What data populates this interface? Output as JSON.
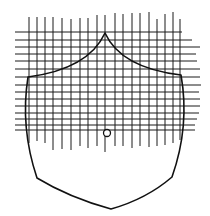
{
  "figure": {
    "stroke_color": "#111111",
    "background": "#ffffff",
    "shield_outline": {
      "apex": [
        105,
        33
      ],
      "upper_left_corner": [
        28,
        77
      ],
      "upper_right_corner": [
        181,
        75
      ],
      "lower_left_corner": [
        37,
        178
      ],
      "lower_right_corner": [
        172,
        177
      ],
      "base_point": [
        111,
        209
      ]
    },
    "center_boss": {
      "cx": 107,
      "cy": 133,
      "r": 3.5
    },
    "vertical_lines": [
      {
        "x": 29,
        "y1": 17,
        "y2": 143
      },
      {
        "x": 37,
        "y1": 17,
        "y2": 141
      },
      {
        "x": 45,
        "y1": 17,
        "y2": 143
      },
      {
        "x": 53,
        "y1": 17,
        "y2": 150
      },
      {
        "x": 62,
        "y1": 18,
        "y2": 149
      },
      {
        "x": 71,
        "y1": 19,
        "y2": 150
      },
      {
        "x": 80,
        "y1": 18,
        "y2": 146
      },
      {
        "x": 88,
        "y1": 18,
        "y2": 148
      },
      {
        "x": 97,
        "y1": 15,
        "y2": 146
      },
      {
        "x": 105,
        "y1": 15,
        "y2": 152
      },
      {
        "x": 115,
        "y1": 13,
        "y2": 146
      },
      {
        "x": 123,
        "y1": 14,
        "y2": 146
      },
      {
        "x": 132,
        "y1": 13,
        "y2": 148
      },
      {
        "x": 140,
        "y1": 13,
        "y2": 146
      },
      {
        "x": 149,
        "y1": 12,
        "y2": 147
      },
      {
        "x": 157,
        "y1": 19,
        "y2": 146
      },
      {
        "x": 165,
        "y1": 14,
        "y2": 145
      },
      {
        "x": 173,
        "y1": 12,
        "y2": 143
      },
      {
        "x": 180,
        "y1": 19,
        "y2": 140
      }
    ],
    "horizontal_lines": [
      {
        "y": 32,
        "x1": 15,
        "x2": 182
      },
      {
        "y": 40,
        "x1": 15,
        "x2": 192
      },
      {
        "y": 47,
        "x1": 15,
        "x2": 200
      },
      {
        "y": 54,
        "x1": 15,
        "x2": 196
      },
      {
        "y": 61,
        "x1": 15,
        "x2": 197
      },
      {
        "y": 69,
        "x1": 15,
        "x2": 200
      },
      {
        "y": 77,
        "x1": 15,
        "x2": 200
      },
      {
        "y": 85,
        "x1": 15,
        "x2": 201
      },
      {
        "y": 92,
        "x1": 15,
        "x2": 199
      },
      {
        "y": 99,
        "x1": 15,
        "x2": 200
      },
      {
        "y": 106,
        "x1": 15,
        "x2": 200
      },
      {
        "y": 113,
        "x1": 15,
        "x2": 199
      },
      {
        "y": 119,
        "x1": 15,
        "x2": 197
      },
      {
        "y": 125,
        "x1": 15,
        "x2": 195
      },
      {
        "y": 130,
        "x1": 15,
        "x2": 195
      }
    ]
  }
}
